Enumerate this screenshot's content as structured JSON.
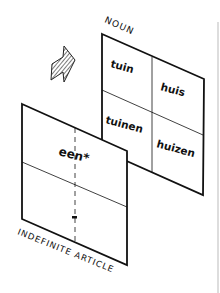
{
  "diagram": {
    "noun_panel": {
      "label": "NOUN",
      "cells": [
        {
          "position": "top-left",
          "text": "tuin"
        },
        {
          "position": "top-right",
          "text": "huis"
        },
        {
          "position": "bottom-left",
          "text": "tuinen"
        },
        {
          "position": "bottom-right",
          "text": "huizen"
        }
      ]
    },
    "article_panel": {
      "label": "INDEFINITE ARTICLE",
      "cells": [
        {
          "position": "top",
          "text": "een*"
        },
        {
          "position": "bottom",
          "text": "-"
        }
      ]
    },
    "arrow_icon": "hatched-arrow-icon",
    "colors": {
      "ink": "#111111",
      "paper": "#ffffff"
    }
  }
}
